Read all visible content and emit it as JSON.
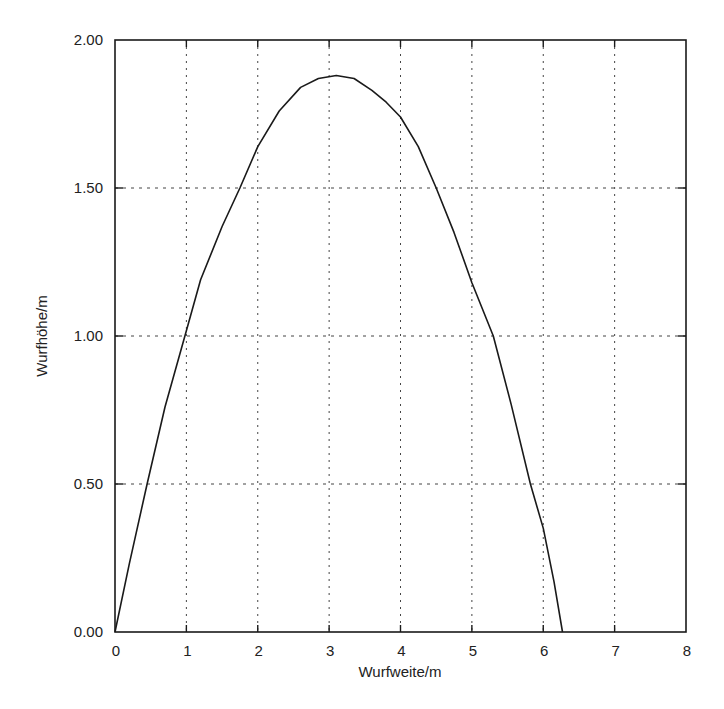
{
  "chart_data": {
    "type": "line",
    "title": "",
    "xlabel": "Wurfweite/m",
    "ylabel": "Wurfhöhe/m",
    "xlim": [
      0,
      8
    ],
    "ylim": [
      0.0,
      2.0
    ],
    "x_ticks": [
      0,
      1,
      2,
      3,
      4,
      5,
      6,
      7,
      8
    ],
    "x_tick_labels": [
      "0",
      "1",
      "2",
      "3",
      "4",
      "5",
      "6",
      "7",
      "8"
    ],
    "y_ticks": [
      0.0,
      0.5,
      1.0,
      1.5,
      2.0
    ],
    "y_tick_labels": [
      "0.00",
      "0.50",
      "1.00",
      "1.50",
      "2.00"
    ],
    "grid": true,
    "grid_style": "dotted",
    "legend": null,
    "series": [
      {
        "name": "Wurfbahn",
        "color": "#1a1a1a",
        "x": [
          0.0,
          0.2,
          0.45,
          0.7,
          0.98,
          1.2,
          1.5,
          1.75,
          2.0,
          2.3,
          2.6,
          2.85,
          3.1,
          3.35,
          3.6,
          3.8,
          4.0,
          4.25,
          4.5,
          4.75,
          5.0,
          5.3,
          5.55,
          5.82,
          6.0,
          6.15,
          6.27
        ],
        "y": [
          0.0,
          0.23,
          0.5,
          0.76,
          1.0,
          1.19,
          1.37,
          1.5,
          1.64,
          1.76,
          1.84,
          1.87,
          1.88,
          1.87,
          1.83,
          1.79,
          1.74,
          1.64,
          1.5,
          1.35,
          1.18,
          1.0,
          0.77,
          0.5,
          0.35,
          0.17,
          0.0
        ]
      }
    ]
  },
  "colors": {
    "background": "#ffffff",
    "frame": "#1a1a1a",
    "grid": "#444444",
    "curve": "#1a1a1a"
  }
}
